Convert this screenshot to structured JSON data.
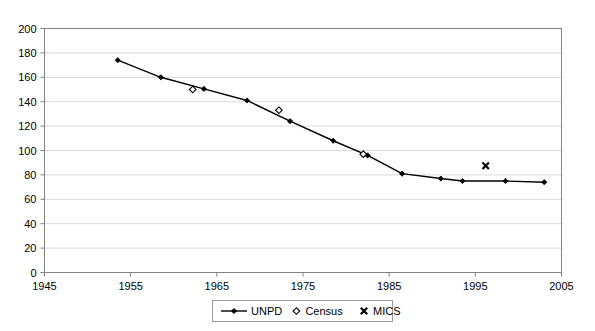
{
  "chart_data": {
    "type": "line",
    "title": "",
    "subtitle": "",
    "xlabel": "",
    "ylabel": "",
    "xlim": [
      1945,
      2005
    ],
    "ylim": [
      0,
      200
    ],
    "grid": true,
    "legend_position": "bottom",
    "x_ticks": [
      "1945",
      "1955",
      "1965",
      "1975",
      "1985",
      "1995",
      "2005"
    ],
    "x_tick_values": [
      1945,
      1955,
      1965,
      1975,
      1985,
      1995,
      2005
    ],
    "y_ticks": [
      "0",
      "20",
      "40",
      "60",
      "80",
      "100",
      "120",
      "140",
      "160",
      "180",
      "200"
    ],
    "y_tick_values": [
      0,
      20,
      40,
      60,
      80,
      100,
      120,
      140,
      160,
      180,
      200
    ],
    "series": [
      {
        "name": "UNPD",
        "marker": "filled-diamond",
        "line": true,
        "color": "#000000",
        "x": [
          1953.5,
          1958.5,
          1963.5,
          1968.5,
          1973.5,
          1978.5,
          1982.5,
          1986.5,
          1991,
          1993.5,
          1998.5,
          2003
        ],
        "values": [
          174,
          160,
          150.5,
          141,
          124,
          108,
          96,
          81,
          77,
          75,
          75,
          74
        ]
      },
      {
        "name": "Census",
        "marker": "open-diamond",
        "line": false,
        "color": "#000000",
        "x": [
          1962.2,
          1972.2,
          1982
        ],
        "values": [
          150,
          133,
          97
        ]
      },
      {
        "name": "MICS",
        "marker": "x",
        "line": false,
        "color": "#000000",
        "x": [
          1996.2
        ],
        "values": [
          87.5
        ]
      }
    ]
  },
  "legend": {
    "items": [
      {
        "label": "UNPD",
        "marker": "line-with-filled-diamond"
      },
      {
        "label": "Census",
        "marker": "open-diamond"
      },
      {
        "label": "MICS",
        "marker": "x"
      }
    ]
  }
}
